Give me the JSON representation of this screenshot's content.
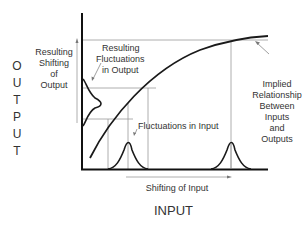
{
  "diagram": {
    "y_axis_title_letters": [
      "O",
      "U",
      "T",
      "P",
      "U",
      "T"
    ],
    "x_axis_title": "INPUT",
    "labels": {
      "resulting_shifting_of_output": [
        "Resulting",
        "Shifting",
        "of",
        "Output"
      ],
      "resulting_fluctuations_in_output": [
        "Resulting",
        "Fluctuations",
        "in Output"
      ],
      "fluctuations_in_input": "Fluctuations in Input",
      "shifting_of_input": "Shifting of Input",
      "implied_relationship": [
        "Implied",
        "Relationship",
        "Between",
        "Inputs",
        "and",
        "Outputs"
      ]
    },
    "colors": {
      "curve": "#1a1a1a",
      "axis": "#111111",
      "guide_lines": "#9a9a9a",
      "text": "#333333"
    }
  }
}
